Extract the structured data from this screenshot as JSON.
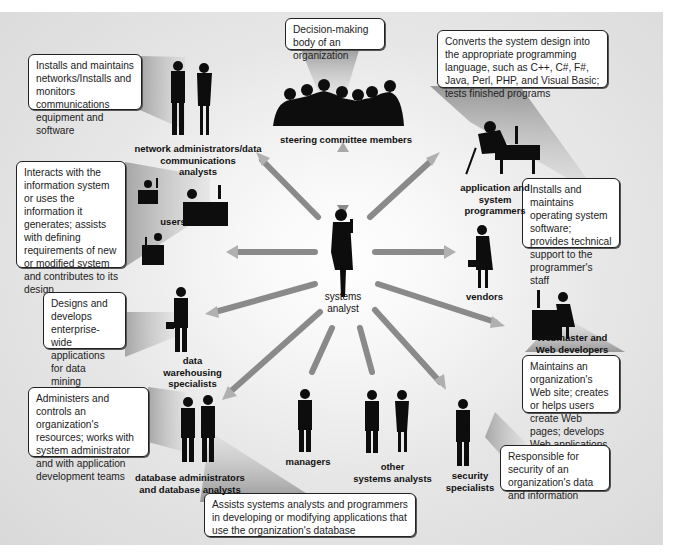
{
  "diagram": {
    "center": {
      "label_line1": "systems",
      "label_line2": "analyst"
    },
    "roles": [
      {
        "id": "network",
        "label_lines": [
          "network administrators/data",
          "communications",
          "analysts"
        ],
        "description": "Installs and maintains networks/Installs and monitors communications equipment and software"
      },
      {
        "id": "steering",
        "label_lines": [
          "steering committee members"
        ],
        "description": "Decision-making body of an organization"
      },
      {
        "id": "programmers",
        "label_lines": [
          "application and",
          "system",
          "programmers"
        ],
        "description": "Converts the system design into the appropriate programming language, such as C++, C#, F#, Java, Perl, PHP, and Visual Basic; tests finished programs"
      },
      {
        "id": "sysprog",
        "label_lines": [],
        "description": "Installs and maintains operating system software; provides technical support to the programmer's staff"
      },
      {
        "id": "users",
        "label_lines": [
          "users"
        ],
        "description": "Interacts with the information system or uses the information it generates; assists with defining requirements of new or modified system and contributes to its design"
      },
      {
        "id": "vendors",
        "label_lines": [
          "vendors"
        ],
        "description": ""
      },
      {
        "id": "webmaster",
        "label_lines": [
          "Webmaster and",
          "Web developers"
        ],
        "description": "Maintains an organization's Web site; creates or helps users create Web pages; develops Web applications"
      },
      {
        "id": "datawarehouse",
        "label_lines": [
          "data",
          "warehousing",
          "specialists"
        ],
        "description": "Designs and develops enterprise-wide applications for data mining"
      },
      {
        "id": "dba",
        "label_lines": [
          "database administrators",
          "and database analysts"
        ],
        "description": "Administers and controls an organization's resources; works with system administrator and with application development teams"
      },
      {
        "id": "dbanalyst",
        "label_lines": [],
        "description": "Assists systems analysts and programmers in developing or modifying applications that use the organization's database"
      },
      {
        "id": "managers",
        "label_lines": [
          "managers"
        ],
        "description": ""
      },
      {
        "id": "othersa",
        "label_lines": [
          "other",
          "systems analysts"
        ],
        "description": ""
      },
      {
        "id": "security",
        "label_lines": [
          "security",
          "specialists"
        ],
        "description": "Responsible for security of an organization's data and information"
      }
    ],
    "colors": {
      "box_border": "#222222",
      "silhouette": "#0d0d0d",
      "arrow_dark": "#6a6a6a",
      "arrow_light": "#d8d8d8",
      "background": "#dcdcdc"
    }
  }
}
